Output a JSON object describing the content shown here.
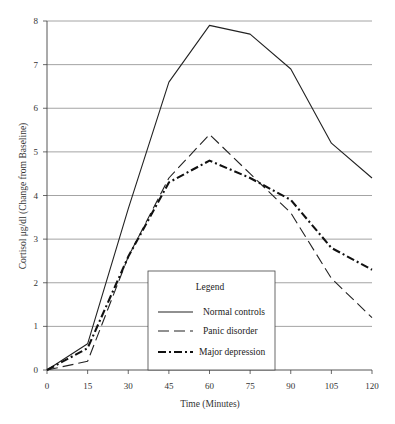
{
  "chart_data": {
    "type": "line",
    "title": "",
    "xlabel": "Time (Minutes)",
    "ylabel": "Cortisol μg/dl (Change from Baseline)",
    "x": [
      0,
      15,
      30,
      45,
      60,
      75,
      90,
      105,
      120
    ],
    "xticks": [
      "0",
      "15",
      "30",
      "45",
      "60",
      "75",
      "90",
      "105",
      "120"
    ],
    "yticks": [
      "0",
      "1",
      "2",
      "3",
      "4",
      "5",
      "6",
      "7",
      "8"
    ],
    "xlim": [
      0,
      120
    ],
    "ylim": [
      0,
      8
    ],
    "grid": "horizontal",
    "legend_position": "lower-center inside",
    "legend_title": "Legend",
    "series": [
      {
        "name": "Normal controls",
        "style": "solid",
        "values": [
          0,
          0.6,
          3.7,
          6.6,
          7.9,
          7.7,
          6.9,
          5.2,
          4.4
        ]
      },
      {
        "name": "Panic disorder",
        "style": "dashed",
        "values": [
          0,
          0.2,
          2.6,
          4.4,
          5.4,
          4.5,
          3.6,
          2.1,
          1.2
        ]
      },
      {
        "name": "Major depression",
        "style": "dash-dot",
        "values": [
          0,
          0.5,
          2.6,
          4.3,
          4.8,
          4.4,
          3.9,
          2.8,
          2.3
        ]
      }
    ]
  },
  "legend": {
    "title": "Legend",
    "items": [
      {
        "label": "Normal controls"
      },
      {
        "label": "Panic disorder"
      },
      {
        "label": "Major depression"
      }
    ]
  }
}
